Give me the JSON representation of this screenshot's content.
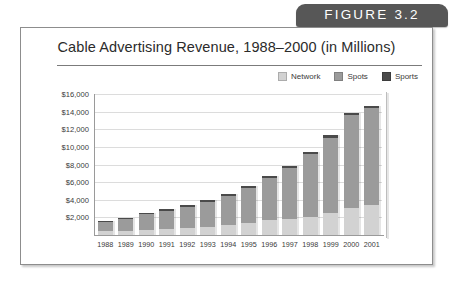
{
  "figure": {
    "tab_label": "FIGURE 3.2"
  },
  "card": {
    "title": "Cable Advertising Revenue, 1988–2000 (in Millions)"
  },
  "legend": {
    "position": "top-right",
    "items": [
      {
        "label": "Network",
        "color": "#d2d2d2"
      },
      {
        "label": "Spots",
        "color": "#9b9b9b"
      },
      {
        "label": "Sports",
        "color": "#4a4a4a"
      }
    ]
  },
  "chart_data": {
    "type": "bar",
    "stacked": true,
    "title": "Cable Advertising Revenue, 1988–2000 (in Millions)",
    "xlabel": "",
    "ylabel": "",
    "ylim": [
      0,
      16000
    ],
    "ytick_labels": [
      "$16,000",
      "$14,000",
      "$12,000",
      "$10,000",
      "$8,000",
      "$6,000",
      "$4,000",
      "$2,000"
    ],
    "ytick_values": [
      16000,
      14000,
      12000,
      10000,
      8000,
      6000,
      4000,
      2000
    ],
    "grid": true,
    "categories": [
      "1988",
      "1989",
      "1990",
      "1991",
      "1992",
      "1993",
      "1994",
      "1995",
      "1996",
      "1997",
      "1998",
      "1999",
      "2000",
      "2001"
    ],
    "series": [
      {
        "name": "Network",
        "color": "#d2d2d2",
        "values": [
          400,
          480,
          600,
          700,
          800,
          950,
          1150,
          1400,
          1650,
          1850,
          2100,
          2550,
          3100,
          3350
        ]
      },
      {
        "name": "Spots",
        "color": "#9b9b9b",
        "values": [
          1120,
          1380,
          1830,
          2080,
          2420,
          2830,
          3310,
          3970,
          4850,
          5700,
          7050,
          8450,
          10500,
          11050
        ]
      },
      {
        "name": "Sports",
        "color": "#4a4a4a",
        "values": [
          80,
          90,
          120,
          140,
          160,
          180,
          190,
          200,
          230,
          280,
          280,
          330,
          300,
          270
        ]
      }
    ],
    "totals": [
      1600,
      1950,
      2550,
      2920,
      3380,
      3960,
      4650,
      5570,
      6730,
      7830,
      9430,
      11330,
      13900,
      14670
    ]
  }
}
